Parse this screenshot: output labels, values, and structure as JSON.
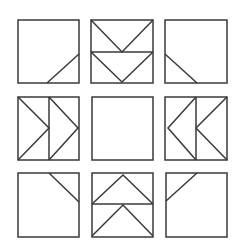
{
  "puzzle": {
    "description": "3x3 grid of squares with line patterns",
    "stroke_color": "#3a3a3a",
    "background": "#ffffff",
    "cells": [
      {
        "row": 1,
        "col": 1,
        "pattern": "diagonal bottom-right corner"
      },
      {
        "row": 1,
        "col": 2,
        "pattern": "two downward V shapes stacked, horizontal divider"
      },
      {
        "row": 1,
        "col": 3,
        "pattern": "diagonal bottom-left corner"
      },
      {
        "row": 2,
        "col": 1,
        "pattern": "two right-pointing chevrons, vertical divider"
      },
      {
        "row": 2,
        "col": 2,
        "pattern": "empty"
      },
      {
        "row": 2,
        "col": 3,
        "pattern": "two left-pointing chevrons, vertical divider"
      },
      {
        "row": 3,
        "col": 1,
        "pattern": "diagonal top-right corner"
      },
      {
        "row": 3,
        "col": 2,
        "pattern": "two upward ^ shapes stacked, horizontal divider"
      },
      {
        "row": 3,
        "col": 3,
        "pattern": "diagonal top-left corner"
      }
    ]
  }
}
